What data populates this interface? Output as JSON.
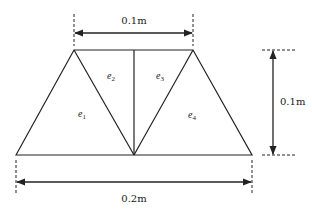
{
  "diagram": {
    "title": "",
    "dimensions": {
      "top_width": "0.1m",
      "bottom_width": "0.2m",
      "height": "0.1m"
    },
    "elements": [
      {
        "id": "e1",
        "base": "e",
        "sub": "1"
      },
      {
        "id": "e2",
        "base": "e",
        "sub": "2"
      },
      {
        "id": "e3",
        "base": "e",
        "sub": "3"
      },
      {
        "id": "e4",
        "base": "e",
        "sub": "4"
      }
    ],
    "colors": {
      "stroke": "#222222",
      "background": "#ffffff"
    }
  }
}
